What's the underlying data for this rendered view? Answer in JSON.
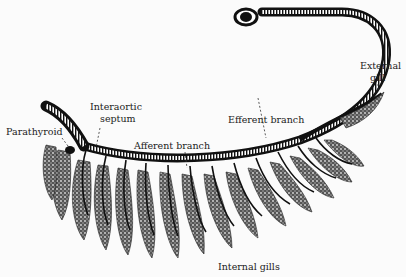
{
  "figure": {
    "labels": {
      "parathyroid": "Parathyroid",
      "interaortic_septum_line1": "Interaortic",
      "interaortic_septum_line2": "septum",
      "afferent_branch": "Afferent branch",
      "efferent_branch": "Efferent branch",
      "external_gill_line1": "External",
      "external_gill_line2": "gill",
      "internal_gills": "Internal gills"
    },
    "colors": {
      "ink": "#111111",
      "background": "#fbfbfb",
      "gill_fill": "#3a3a3a"
    }
  }
}
